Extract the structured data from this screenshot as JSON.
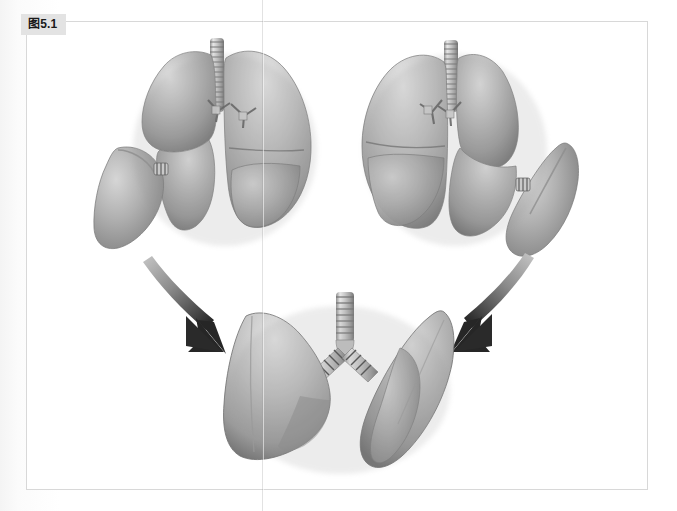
{
  "figure": {
    "badge_label": "图5.1",
    "caption": "",
    "frame_border_color": "#d8d8d8",
    "page_background": "#ffffff"
  },
  "palette": {
    "lung_light": "#cfcfcf",
    "lung_mid": "#a8a8a8",
    "lung_dark": "#7c7c7c",
    "lung_shadow": "#636363",
    "lung_highlight": "#e4e4e4",
    "fissure_line": "#6e6e6e",
    "trachea_light": "#e0e0e0",
    "trachea_ring": "#9a9a9a",
    "trachea_dark": "#6d6d6d",
    "arrow_head": "#2a2a2a",
    "arrow_tail": "#b9b9b9",
    "badge_background": "#e3e3e3",
    "badge_text": "#1a1a1a",
    "seam_line": "#969696"
  },
  "illustration": {
    "type": "anatomical-3d-render",
    "subject": "human lungs",
    "color_mode": "grayscale",
    "groups": [
      {
        "name": "upper-left-lung-assembly",
        "label": "",
        "parts": [
          "right-lung-upper-lobe",
          "right-lung-lower-lobe",
          "left-lung",
          "trachea",
          "bronchus-stubs",
          "detached-lobe"
        ]
      },
      {
        "name": "upper-right-lung-assembly",
        "label": "",
        "parts": [
          "right-lung",
          "left-lung-upper-lobe",
          "left-lung-lower-lobe",
          "trachea",
          "bronchus-stubs",
          "detached-lobe"
        ]
      },
      {
        "name": "bottom-lung-assembly",
        "label": "",
        "parts": [
          "left-lobe-wedge",
          "right-lobe-wedge",
          "trachea",
          "bronchus-left",
          "bronchus-right"
        ]
      }
    ],
    "arrows": [
      {
        "name": "arrow-left",
        "direction": "curving down-right",
        "from": "upper-left-lung-assembly",
        "to": "bottom-lung-assembly"
      },
      {
        "name": "arrow-right",
        "direction": "curving down-left",
        "from": "upper-right-lung-assembly",
        "to": "bottom-lung-assembly"
      }
    ]
  }
}
